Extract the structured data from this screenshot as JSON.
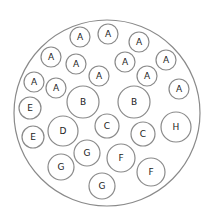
{
  "diagram": {
    "type": "circle-packing",
    "circles": [
      {
        "label": "A",
        "size": "small"
      },
      {
        "label": "A",
        "size": "small"
      },
      {
        "label": "A",
        "size": "small"
      },
      {
        "label": "A",
        "size": "small"
      },
      {
        "label": "A",
        "size": "small"
      },
      {
        "label": "A",
        "size": "small"
      },
      {
        "label": "A",
        "size": "small"
      },
      {
        "label": "A",
        "size": "small"
      },
      {
        "label": "A",
        "size": "small"
      },
      {
        "label": "A",
        "size": "small"
      },
      {
        "label": "A",
        "size": "small"
      },
      {
        "label": "A",
        "size": "small"
      },
      {
        "label": "B",
        "size": "large"
      },
      {
        "label": "B",
        "size": "large"
      },
      {
        "label": "E",
        "size": "small"
      },
      {
        "label": "E",
        "size": "small"
      },
      {
        "label": "D",
        "size": "large"
      },
      {
        "label": "C",
        "size": "medium"
      },
      {
        "label": "C",
        "size": "medium"
      },
      {
        "label": "H",
        "size": "large"
      },
      {
        "label": "G",
        "size": "medium"
      },
      {
        "label": "G",
        "size": "medium"
      },
      {
        "label": "F",
        "size": "medium"
      },
      {
        "label": "F",
        "size": "medium"
      },
      {
        "label": "G",
        "size": "medium"
      }
    ]
  }
}
